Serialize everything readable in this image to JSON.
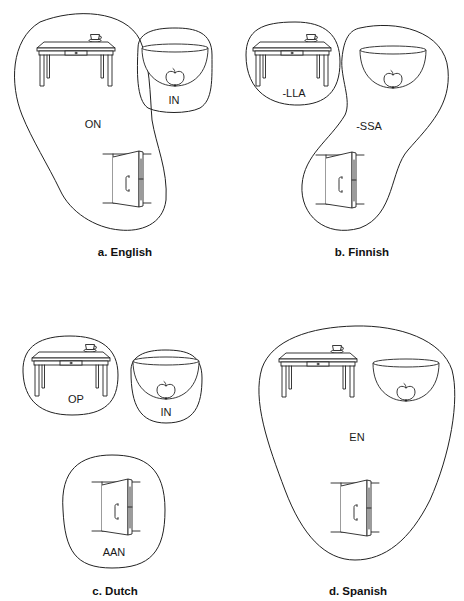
{
  "figure": {
    "scenes": {
      "table": "cup on a table",
      "bowl": "apple in a bowl",
      "door": "handle on a door"
    },
    "panels": [
      {
        "id": "a",
        "caption": "a. English",
        "groups": [
          {
            "label": "ON",
            "scenes": [
              "table",
              "door"
            ]
          },
          {
            "label": "IN",
            "scenes": [
              "bowl"
            ]
          }
        ]
      },
      {
        "id": "b",
        "caption": "b. Finnish",
        "groups": [
          {
            "label": "-LLA",
            "scenes": [
              "table"
            ]
          },
          {
            "label": "-SSA",
            "scenes": [
              "bowl",
              "door"
            ]
          }
        ]
      },
      {
        "id": "c",
        "caption": "c. Dutch",
        "groups": [
          {
            "label": "OP",
            "scenes": [
              "table"
            ]
          },
          {
            "label": "IN",
            "scenes": [
              "bowl"
            ]
          },
          {
            "label": "AAN",
            "scenes": [
              "door"
            ]
          }
        ]
      },
      {
        "id": "d",
        "caption": "d. Spanish",
        "groups": [
          {
            "label": "EN",
            "scenes": [
              "table",
              "bowl",
              "door"
            ]
          }
        ]
      }
    ]
  }
}
